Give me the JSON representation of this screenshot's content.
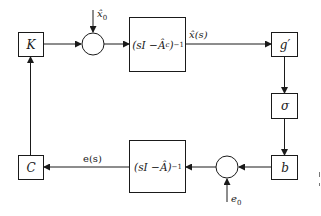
{
  "diagram": {
    "type": "block-diagram",
    "blocks": {
      "K": {
        "label": "K"
      },
      "observer_top": {
        "label": "(sI − Â_c)⁻¹",
        "parts": [
          "(sI − ",
          "Â",
          "c",
          ")",
          "−1"
        ]
      },
      "g_prime": {
        "label": "g′"
      },
      "sigma": {
        "label": "σ"
      },
      "b": {
        "label": "b"
      },
      "observer_bottom": {
        "label": "(sI − Â)⁻¹",
        "parts": [
          "(sI − ",
          "Â",
          ")",
          "−1"
        ]
      },
      "C": {
        "label": "C"
      }
    },
    "signals": {
      "x0_hat": {
        "label": "x̂",
        "sub": "0"
      },
      "x_hat_s": {
        "label": "x̂(s)"
      },
      "e_s": {
        "label": "e(s)"
      },
      "e0": {
        "label": "e",
        "sub": "0"
      }
    },
    "summing_junctions": [
      "top-summer",
      "bottom-summer"
    ],
    "connections": [
      "K → top-summer",
      "x̂0 → top-summer",
      "top-summer → (sI − Âc)⁻¹",
      "(sI − Âc)⁻¹ → g′ [x̂(s)]",
      "g′ → σ",
      "σ → b",
      "b → bottom-summer",
      "e0 → bottom-summer",
      "bottom-summer → (sI − Â)⁻¹",
      "(sI − Â)⁻¹ → C [e(s)]",
      "C → K"
    ],
    "colors": {
      "line": "#1a1a1a",
      "background": "#ffffff"
    }
  }
}
